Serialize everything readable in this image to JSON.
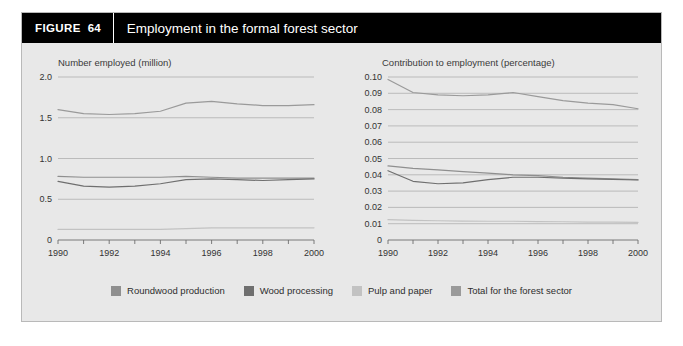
{
  "header": {
    "figure_label": "FIGURE",
    "figure_number": "64",
    "title": "Employment in the formal forest sector"
  },
  "colors": {
    "panel_background": "#e8e8e8",
    "header_background": "#000000",
    "header_text": "#ffffff",
    "gridline": "#a8a8a8",
    "axis": "#6e6e6e",
    "roundwood_production": "#8f8f8f",
    "wood_processing": "#6f6f6f",
    "pulp_and_paper": "#c2c2c2",
    "total_for_the_forest_sector": "#9a9a9a"
  },
  "legend": {
    "items": [
      {
        "label": "Roundwood production",
        "color": "#8f8f8f"
      },
      {
        "label": "Wood processing",
        "color": "#6f6f6f"
      },
      {
        "label": "Pulp and paper",
        "color": "#c2c2c2"
      },
      {
        "label": "Total for the forest sector",
        "color": "#9a9a9a"
      }
    ]
  },
  "chart_data": [
    {
      "type": "line",
      "panel": "left",
      "title": "Number employed (million)",
      "xlabel": "",
      "ylabel": "Number employed (million)",
      "x": [
        1990,
        1991,
        1992,
        1993,
        1994,
        1995,
        1996,
        1997,
        1998,
        1999,
        2000
      ],
      "xlim": [
        1990,
        2000
      ],
      "ylim": [
        0,
        2.0
      ],
      "ytick_labels": [
        "0",
        "0.5",
        "1.0",
        "1.5",
        "2.0"
      ],
      "ytick_values": [
        0,
        0.5,
        1.0,
        1.5,
        2.0
      ],
      "xtick_labels": [
        "1990",
        "1992",
        "1994",
        "1996",
        "1998",
        "2000"
      ],
      "xtick_values": [
        1990,
        1992,
        1994,
        1996,
        1998,
        2000
      ],
      "minor_xticks": [
        1990,
        1991,
        1992,
        1993,
        1994,
        1995,
        1996,
        1997,
        1998,
        1999,
        2000
      ],
      "grid": true,
      "legend_position": "bottom",
      "series": [
        {
          "name": "Total for the forest sector",
          "color": "#9a9a9a",
          "values": [
            1.6,
            1.55,
            1.54,
            1.55,
            1.58,
            1.68,
            1.7,
            1.67,
            1.65,
            1.65,
            1.66
          ]
        },
        {
          "name": "Roundwood production",
          "color": "#8f8f8f",
          "values": [
            0.78,
            0.77,
            0.77,
            0.77,
            0.77,
            0.78,
            0.77,
            0.76,
            0.76,
            0.76,
            0.76
          ]
        },
        {
          "name": "Wood processing",
          "color": "#6f6f6f",
          "values": [
            0.72,
            0.66,
            0.65,
            0.66,
            0.69,
            0.74,
            0.75,
            0.74,
            0.73,
            0.74,
            0.75
          ]
        },
        {
          "name": "Pulp and paper",
          "color": "#c2c2c2",
          "values": [
            0.13,
            0.13,
            0.13,
            0.13,
            0.13,
            0.14,
            0.15,
            0.15,
            0.15,
            0.15,
            0.15
          ]
        }
      ]
    },
    {
      "type": "line",
      "panel": "right",
      "title": "Contribution to employment (percentage)",
      "xlabel": "",
      "ylabel": "Contribution to employment (percentage)",
      "x": [
        1990,
        1991,
        1992,
        1993,
        1994,
        1995,
        1996,
        1997,
        1998,
        1999,
        2000
      ],
      "xlim": [
        1990,
        2000
      ],
      "ylim": [
        0,
        0.1
      ],
      "ytick_labels": [
        "0",
        "0.01",
        "0.02",
        "0.03",
        "0.04",
        "0.05",
        "0.06",
        "0.07",
        "0.08",
        "0.09",
        "0.10"
      ],
      "ytick_values": [
        0,
        0.01,
        0.02,
        0.03,
        0.04,
        0.05,
        0.06,
        0.07,
        0.08,
        0.09,
        0.1
      ],
      "xtick_labels": [
        "1990",
        "1992",
        "1994",
        "1996",
        "1998",
        "2000"
      ],
      "xtick_values": [
        1990,
        1992,
        1994,
        1996,
        1998,
        2000
      ],
      "minor_xticks": [
        1990,
        1991,
        1992,
        1993,
        1994,
        1995,
        1996,
        1997,
        1998,
        1999,
        2000
      ],
      "grid": true,
      "legend_position": "bottom",
      "series": [
        {
          "name": "Total for the forest sector",
          "color": "#9a9a9a",
          "values": [
            0.0985,
            0.0905,
            0.089,
            0.0885,
            0.089,
            0.0905,
            0.088,
            0.0855,
            0.084,
            0.083,
            0.0805
          ]
        },
        {
          "name": "Roundwood production",
          "color": "#8f8f8f",
          "values": [
            0.0455,
            0.044,
            0.043,
            0.042,
            0.041,
            0.04,
            0.0395,
            0.0385,
            0.038,
            0.0375,
            0.037
          ]
        },
        {
          "name": "Wood processing",
          "color": "#6f6f6f",
          "values": [
            0.0425,
            0.036,
            0.0345,
            0.035,
            0.037,
            0.0385,
            0.0385,
            0.038,
            0.0375,
            0.0372,
            0.0368
          ]
        },
        {
          "name": "Pulp and paper",
          "color": "#c2c2c2",
          "values": [
            0.0125,
            0.012,
            0.0118,
            0.0116,
            0.0115,
            0.0115,
            0.0113,
            0.0112,
            0.011,
            0.011,
            0.0108
          ]
        }
      ]
    }
  ]
}
